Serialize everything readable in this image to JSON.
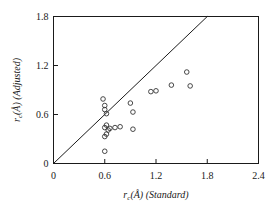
{
  "chart_data": {
    "type": "scatter",
    "title": "",
    "xlabel": "r_c (Å) (Standard)",
    "ylabel": "r_c (Å) (Adjusted)",
    "xlabel_parts": {
      "symbol": "r",
      "subscript": "c",
      "unit": "(Å)",
      "qualifier": "(Standard)"
    },
    "ylabel_parts": {
      "symbol": "r",
      "subscript": "c",
      "unit": "(Å)",
      "qualifier": "(Adjusted)"
    },
    "xlim": [
      0,
      2.4
    ],
    "ylim": [
      0,
      1.8
    ],
    "xticks": [
      0,
      0.6,
      1.2,
      1.8,
      2.4
    ],
    "yticks": [
      0,
      0.6,
      1.2,
      1.8
    ],
    "xtick_labels": [
      "0",
      "0.6",
      "1.2",
      "1.8",
      "2.4"
    ],
    "ytick_labels": [
      "0",
      "0.6",
      "1.2",
      "1.8"
    ],
    "grid": false,
    "legend": null,
    "marker": "open-circle",
    "marker_color": "#333333",
    "marker_size": 4.6,
    "reference_line": {
      "name": "identity-line",
      "label": "y = x",
      "from": [
        0,
        0
      ],
      "to": [
        1.8,
        1.8
      ],
      "color": "#1a1a1a",
      "width": 1
    },
    "points": [
      [
        0.58,
        0.79
      ],
      [
        0.6,
        0.71
      ],
      [
        0.6,
        0.66
      ],
      [
        0.62,
        0.61
      ],
      [
        0.6,
        0.44
      ],
      [
        0.62,
        0.47
      ],
      [
        0.64,
        0.41
      ],
      [
        0.66,
        0.43
      ],
      [
        0.6,
        0.33
      ],
      [
        0.62,
        0.36
      ],
      [
        0.72,
        0.44
      ],
      [
        0.78,
        0.45
      ],
      [
        0.6,
        0.15
      ],
      [
        0.9,
        0.74
      ],
      [
        0.93,
        0.63
      ],
      [
        0.93,
        0.42
      ],
      [
        1.14,
        0.88
      ],
      [
        1.2,
        0.89
      ],
      [
        1.38,
        0.96
      ],
      [
        1.56,
        1.12
      ],
      [
        1.6,
        0.95
      ]
    ],
    "n_points": 21,
    "series": [
      {
        "name": "r_c adjusted vs standard",
        "x": [
          0.58,
          0.6,
          0.6,
          0.62,
          0.6,
          0.62,
          0.64,
          0.66,
          0.6,
          0.62,
          0.72,
          0.78,
          0.6,
          0.9,
          0.93,
          0.93,
          1.14,
          1.2,
          1.38,
          1.56,
          1.6
        ],
        "y": [
          0.79,
          0.71,
          0.66,
          0.61,
          0.44,
          0.47,
          0.41,
          0.43,
          0.33,
          0.36,
          0.44,
          0.45,
          0.15,
          0.74,
          0.63,
          0.42,
          0.88,
          0.89,
          0.96,
          1.12,
          0.95
        ]
      }
    ]
  },
  "figure": {
    "background": "#ffffff",
    "axis_color": "#1a1a1a",
    "text_color": "#1a1a1a"
  }
}
